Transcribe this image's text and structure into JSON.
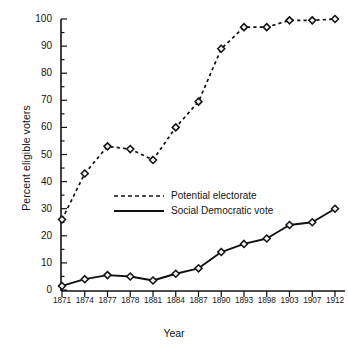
{
  "chart_data": {
    "type": "line",
    "title": "",
    "xlabel": "Year",
    "ylabel": "Percent eligible voters",
    "categories": [
      "1871",
      "1874",
      "1877",
      "1878",
      "1881",
      "1884",
      "1887",
      "1890",
      "1893",
      "1898",
      "1903",
      "1907",
      "1912"
    ],
    "ylim": [
      0,
      100
    ],
    "yticks": [
      0,
      10,
      20,
      30,
      40,
      50,
      60,
      70,
      80,
      90,
      100
    ],
    "ytick_labels": [
      "0",
      "10",
      "20",
      "30",
      "40",
      "50",
      "60",
      "70",
      "80",
      "90",
      "100"
    ],
    "minor_tick_step": 5,
    "grid": false,
    "legend_position": "center",
    "series": [
      {
        "name": "Potential electorate",
        "style": "dashed",
        "marker": "diamond",
        "values": [
          26,
          43,
          53,
          52,
          48,
          60,
          69.5,
          89,
          97,
          97,
          99.5,
          99.5,
          100
        ]
      },
      {
        "name": "Social Democratic vote",
        "style": "solid",
        "marker": "diamond",
        "values": [
          1.5,
          4,
          5.5,
          5,
          3.5,
          6,
          8,
          14,
          17,
          19,
          24,
          25,
          30
        ]
      }
    ]
  },
  "axes": {
    "y_title": "Percent eligible voters",
    "x_title": "Year"
  },
  "legend": {
    "items": [
      {
        "label": "Potential electorate",
        "style": "dashed"
      },
      {
        "label": "Social Democratic vote",
        "style": "solid"
      }
    ]
  },
  "colors": {
    "ink": "#111111",
    "background": "#ffffff",
    "marker_fill": "#f2f2f2"
  }
}
